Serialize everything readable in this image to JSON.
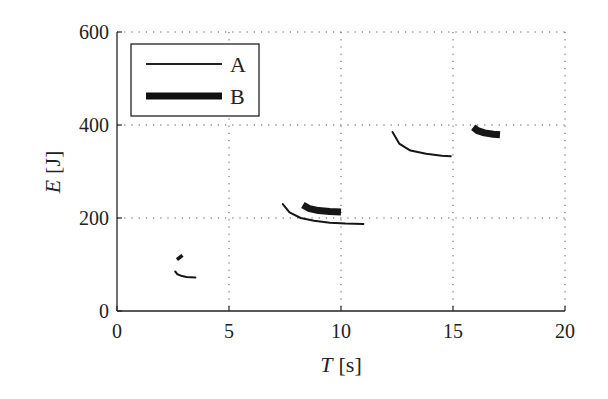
{
  "chart_data": {
    "type": "line",
    "title": "",
    "xlabel": "T [s]",
    "ylabel": "E [J]",
    "xlabel_var": "T",
    "xlabel_unit": "[s]",
    "ylabel_var": "E",
    "ylabel_unit": "[J]",
    "xlim": [
      0,
      20
    ],
    "ylim": [
      0,
      600
    ],
    "xticks": [
      0,
      5,
      10,
      15,
      20
    ],
    "yticks": [
      0,
      200,
      400,
      600
    ],
    "grid": true,
    "grid_style": "dotted",
    "legend_position": "upper left",
    "series": [
      {
        "name": "A",
        "style": "thin solid line",
        "segments": [
          {
            "x": [
              2.6,
              2.7,
              2.9,
              3.1,
              3.5
            ],
            "y": [
              85,
              79,
              75,
              73,
              72
            ]
          },
          {
            "x": [
              7.4,
              7.7,
              8.2,
              8.8,
              9.5,
              10.2,
              11.0
            ],
            "y": [
              230,
              212,
              200,
              194,
              190,
              188,
              187
            ]
          },
          {
            "x": [
              12.3,
              12.6,
              13.1,
              13.8,
              14.5,
              14.9
            ],
            "y": [
              385,
              360,
              345,
              338,
              334,
              333
            ]
          },
          {
            "x": [],
            "y": []
          }
        ]
      },
      {
        "name": "B",
        "style": "thick solid line",
        "segments": [
          {
            "x": [
              2.75,
              2.85
            ],
            "y": [
              118,
              112
            ]
          },
          {
            "x": [
              8.3,
              8.6,
              9.0,
              9.5,
              10.0
            ],
            "y": [
              228,
              220,
              216,
              214,
              213
            ]
          },
          {
            "x": [
              15.9,
              16.1,
              16.4,
              16.8,
              17.1
            ],
            "y": [
              395,
              388,
              383,
              380,
              379
            ]
          }
        ]
      }
    ]
  },
  "legend": {
    "items": [
      {
        "label": "A"
      },
      {
        "label": "B"
      }
    ]
  },
  "axes": {
    "x_tick_labels": [
      "0",
      "5",
      "10",
      "15",
      "20"
    ],
    "y_tick_labels": [
      "0",
      "200",
      "400",
      "600"
    ]
  }
}
